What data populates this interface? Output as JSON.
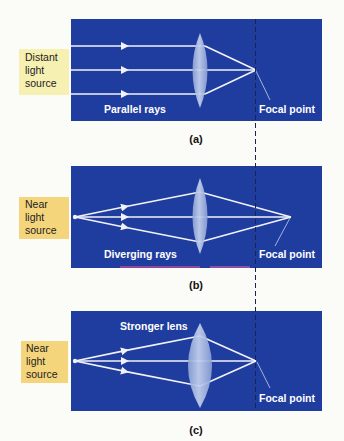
{
  "colors": {
    "panel_blue": "#1f3d9e",
    "ray": "#f2f2f6",
    "lens_fill": "#9db0de",
    "label_pale_yellow": "#f6f0b2",
    "label_yellow": "#f4d57c",
    "dashed_line": "#222a50"
  },
  "panels": [
    {
      "id": "a",
      "caption": "(a)",
      "source_label": [
        "Distant",
        "light",
        "source"
      ],
      "ray_label": "Parallel rays",
      "focal_label": "Focal point"
    },
    {
      "id": "b",
      "caption": "(b)",
      "source_label": [
        "Near",
        "light",
        "source"
      ],
      "ray_label": "Diverging rays",
      "focal_label": "Focal point"
    },
    {
      "id": "c",
      "caption": "(c)",
      "source_label": [
        "Near",
        "light",
        "source"
      ],
      "lens_label": "Stronger lens",
      "focal_label": "Focal point"
    }
  ]
}
